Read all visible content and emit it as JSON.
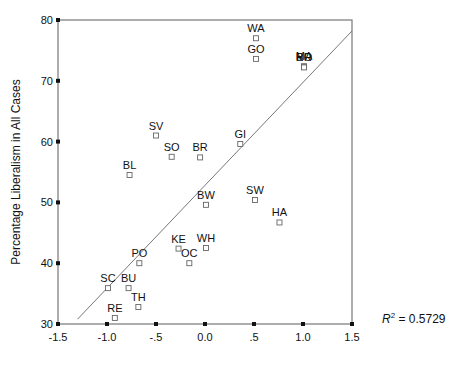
{
  "chart_data": {
    "type": "scatter",
    "title": "",
    "xlabel": "",
    "ylabel": "Percentage Liberalism in All Cases",
    "xlim": [
      -1.5,
      1.5
    ],
    "ylim": [
      30,
      80
    ],
    "x_ticks": [
      "-1.5",
      "-1.0",
      "-.5",
      "0.0",
      ".5",
      "1.0",
      "1.5"
    ],
    "x_tick_values": [
      -1.5,
      -1.0,
      -0.5,
      0.0,
      0.5,
      1.0,
      1.5
    ],
    "y_ticks": [
      "30",
      "40",
      "50",
      "60",
      "70",
      "80"
    ],
    "y_tick_values": [
      30,
      40,
      50,
      60,
      70,
      80
    ],
    "grid": false,
    "legend": null,
    "annotation": {
      "r2_label": "R",
      "r2_sup": "2",
      "r2_value": " = 0.5729"
    },
    "fit_line": {
      "x0": -1.3,
      "y0": 30.8,
      "x1": 1.5,
      "y1": 78.2
    },
    "points": [
      {
        "label": "WA",
        "x": 0.52,
        "y": 77.0
      },
      {
        "label": "GO",
        "x": 0.52,
        "y": 73.6
      },
      {
        "label": "MA",
        "x": 1.01,
        "y": 72.4
      },
      {
        "label": "BR",
        "x": 1.01,
        "y": 72.3
      },
      {
        "label": "RO",
        "x": 1.01,
        "y": 72.2
      },
      {
        "label": "SV",
        "x": -0.5,
        "y": 61.0
      },
      {
        "label": "GI",
        "x": 0.36,
        "y": 59.6
      },
      {
        "label": "SO",
        "x": -0.34,
        "y": 57.5
      },
      {
        "label": "BR",
        "x": -0.05,
        "y": 57.4
      },
      {
        "label": "BL",
        "x": -0.77,
        "y": 54.5
      },
      {
        "label": "SW",
        "x": 0.51,
        "y": 50.4
      },
      {
        "label": "BW",
        "x": 0.01,
        "y": 49.6
      },
      {
        "label": "HA",
        "x": 0.76,
        "y": 46.7
      },
      {
        "label": "WH",
        "x": 0.01,
        "y": 42.5
      },
      {
        "label": "KE",
        "x": -0.27,
        "y": 42.4
      },
      {
        "label": "OC",
        "x": -0.16,
        "y": 40.0
      },
      {
        "label": "PO",
        "x": -0.67,
        "y": 40.0
      },
      {
        "label": "SC",
        "x": -0.99,
        "y": 35.9
      },
      {
        "label": "BU",
        "x": -0.78,
        "y": 35.9
      },
      {
        "label": "TH",
        "x": -0.68,
        "y": 32.8
      },
      {
        "label": "RE",
        "x": -0.92,
        "y": 31.0
      }
    ]
  },
  "colors": {
    "axis": "#777777",
    "tick": "#111111",
    "marker": "#666666",
    "fit_line": "#777777",
    "text": "#111111"
  }
}
